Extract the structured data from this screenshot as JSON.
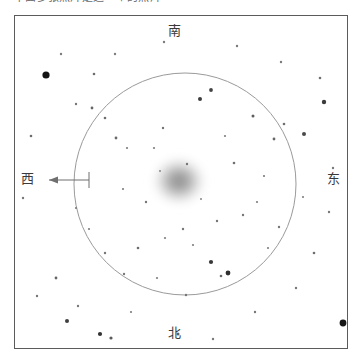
{
  "caption": {
    "text": "下面多张照片是这一个的照片"
  },
  "chart": {
    "frame": {
      "x": 14,
      "y": 15,
      "w": 334,
      "h": 334,
      "border_color": "#5b5b5b"
    },
    "background": "#ffffff"
  },
  "directions": {
    "top": {
      "label": "南",
      "meaning": "south"
    },
    "bottom": {
      "label": "北",
      "meaning": "north"
    },
    "left": {
      "label": "西",
      "meaning": "west"
    },
    "right": {
      "label": "东",
      "meaning": "east"
    }
  },
  "scale_arrow": {
    "direction": "left",
    "color": "#6f6f6f",
    "x_start": 74,
    "x_end": 34,
    "y": 164,
    "tick_height": 16
  },
  "fov_circle": {
    "cx": 170,
    "cy": 168,
    "r": 111,
    "stroke": "#9a9a9a",
    "stroke_width": 1
  },
  "chart_data": {
    "type": "scatter",
    "title": "",
    "xlabel": "",
    "ylabel": "",
    "xlim": [
      0,
      334
    ],
    "ylim": [
      0,
      334
    ],
    "grid": false,
    "legend": "none",
    "nebula": {
      "name": "diffuse-cluster",
      "cx": 164,
      "cy": 165,
      "rx": 30,
      "ry": 27,
      "core_color": "#8d8d8d",
      "edge_color": "#ffffff"
    },
    "stars": [
      {
        "x": 31,
        "y": 59,
        "r": 3.6,
        "c": "#141414"
      },
      {
        "x": 309,
        "y": 86,
        "r": 2.2,
        "c": "#3b3b3b"
      },
      {
        "x": 289,
        "y": 118,
        "r": 2.0,
        "c": "#4a4a4a"
      },
      {
        "x": 328,
        "y": 307,
        "r": 3.4,
        "c": "#161616"
      },
      {
        "x": 52,
        "y": 305,
        "r": 2.0,
        "c": "#3f3f3f"
      },
      {
        "x": 85,
        "y": 318,
        "r": 2.1,
        "c": "#333333"
      },
      {
        "x": 96,
        "y": 322,
        "r": 1.6,
        "c": "#5a5a5a"
      },
      {
        "x": 213,
        "y": 257,
        "r": 2.4,
        "c": "#2e2e2e"
      },
      {
        "x": 196,
        "y": 246,
        "r": 2.1,
        "c": "#383838"
      },
      {
        "x": 185,
        "y": 83,
        "r": 2.0,
        "c": "#3d3d3d"
      },
      {
        "x": 196,
        "y": 74,
        "r": 1.9,
        "c": "#434343"
      },
      {
        "x": 238,
        "y": 100,
        "r": 1.5,
        "c": "#5e5e5e"
      },
      {
        "x": 259,
        "y": 123,
        "r": 1.4,
        "c": "#676767"
      },
      {
        "x": 269,
        "y": 108,
        "r": 1.3,
        "c": "#6e6e6e"
      },
      {
        "x": 219,
        "y": 147,
        "r": 1.3,
        "c": "#707070"
      },
      {
        "x": 172,
        "y": 148,
        "r": 1.2,
        "c": "#757575"
      },
      {
        "x": 148,
        "y": 112,
        "r": 1.2,
        "c": "#737373"
      },
      {
        "x": 101,
        "y": 122,
        "r": 1.4,
        "c": "#6a6a6a"
      },
      {
        "x": 90,
        "y": 102,
        "r": 1.3,
        "c": "#6d6d6d"
      },
      {
        "x": 77,
        "y": 92,
        "r": 1.4,
        "c": "#666666"
      },
      {
        "x": 61,
        "y": 88,
        "r": 1.2,
        "c": "#777777"
      },
      {
        "x": 112,
        "y": 132,
        "r": 1.1,
        "c": "#7b7b7b"
      },
      {
        "x": 139,
        "y": 132,
        "r": 1.1,
        "c": "#7c7c7c"
      },
      {
        "x": 131,
        "y": 186,
        "r": 1.2,
        "c": "#757575"
      },
      {
        "x": 108,
        "y": 173,
        "r": 1.1,
        "c": "#7d7d7d"
      },
      {
        "x": 123,
        "y": 232,
        "r": 1.3,
        "c": "#6b6b6b"
      },
      {
        "x": 150,
        "y": 222,
        "r": 1.1,
        "c": "#7e7e7e"
      },
      {
        "x": 168,
        "y": 213,
        "r": 1.2,
        "c": "#767676"
      },
      {
        "x": 178,
        "y": 229,
        "r": 1.1,
        "c": "#7d7d7d"
      },
      {
        "x": 202,
        "y": 205,
        "r": 1.2,
        "c": "#747474"
      },
      {
        "x": 228,
        "y": 199,
        "r": 1.2,
        "c": "#757575"
      },
      {
        "x": 242,
        "y": 186,
        "r": 1.1,
        "c": "#7e7e7e"
      },
      {
        "x": 249,
        "y": 160,
        "r": 1.1,
        "c": "#7c7c7c"
      },
      {
        "x": 264,
        "y": 211,
        "r": 1.2,
        "c": "#777777"
      },
      {
        "x": 253,
        "y": 232,
        "r": 1.1,
        "c": "#7f7f7f"
      },
      {
        "x": 206,
        "y": 260,
        "r": 1.3,
        "c": "#6a6a6a"
      },
      {
        "x": 171,
        "y": 279,
        "r": 1.2,
        "c": "#767676"
      },
      {
        "x": 142,
        "y": 262,
        "r": 1.1,
        "c": "#7d7d7d"
      },
      {
        "x": 109,
        "y": 258,
        "r": 1.2,
        "c": "#787878"
      },
      {
        "x": 90,
        "y": 237,
        "r": 1.2,
        "c": "#757575"
      },
      {
        "x": 74,
        "y": 213,
        "r": 1.1,
        "c": "#7e7e7e"
      },
      {
        "x": 61,
        "y": 192,
        "r": 1.1,
        "c": "#7c7c7c"
      },
      {
        "x": 41,
        "y": 262,
        "r": 1.4,
        "c": "#656565"
      },
      {
        "x": 79,
        "y": 58,
        "r": 1.3,
        "c": "#6c6c6c"
      },
      {
        "x": 16,
        "y": 120,
        "r": 1.3,
        "c": "#6b6b6b"
      },
      {
        "x": 8,
        "y": 182,
        "r": 1.2,
        "c": "#777777"
      },
      {
        "x": 22,
        "y": 280,
        "r": 1.2,
        "c": "#767676"
      },
      {
        "x": 63,
        "y": 290,
        "r": 1.2,
        "c": "#787878"
      },
      {
        "x": 116,
        "y": 296,
        "r": 1.1,
        "c": "#7e7e7e"
      },
      {
        "x": 163,
        "y": 318,
        "r": 1.5,
        "c": "#5f5f5f"
      },
      {
        "x": 198,
        "y": 323,
        "r": 1.2,
        "c": "#787878"
      },
      {
        "x": 240,
        "y": 296,
        "r": 1.2,
        "c": "#767676"
      },
      {
        "x": 281,
        "y": 272,
        "r": 1.2,
        "c": "#777777"
      },
      {
        "x": 299,
        "y": 237,
        "r": 1.3,
        "c": "#6e6e6e"
      },
      {
        "x": 314,
        "y": 196,
        "r": 1.2,
        "c": "#787878"
      },
      {
        "x": 318,
        "y": 152,
        "r": 1.2,
        "c": "#7a7a7a"
      },
      {
        "x": 305,
        "y": 62,
        "r": 1.3,
        "c": "#6f6f6f"
      },
      {
        "x": 266,
        "y": 46,
        "r": 1.2,
        "c": "#7a7a7a"
      },
      {
        "x": 222,
        "y": 30,
        "r": 1.2,
        "c": "#797979"
      },
      {
        "x": 149,
        "y": 26,
        "r": 1.2,
        "c": "#7b7b7b"
      },
      {
        "x": 100,
        "y": 38,
        "r": 1.2,
        "c": "#7d7d7d"
      },
      {
        "x": 46,
        "y": 38,
        "r": 1.2,
        "c": "#7c7c7c"
      },
      {
        "x": 186,
        "y": 183,
        "r": 1.0,
        "c": "#858585"
      },
      {
        "x": 145,
        "y": 155,
        "r": 1.0,
        "c": "#878787"
      },
      {
        "x": 210,
        "y": 120,
        "r": 1.1,
        "c": "#7f7f7f"
      },
      {
        "x": 288,
        "y": 181,
        "r": 1.1,
        "c": "#808080"
      }
    ]
  }
}
